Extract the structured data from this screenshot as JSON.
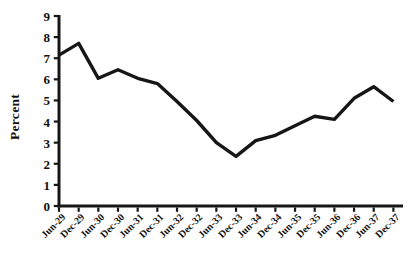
{
  "figure": {
    "title": "",
    "ylabel": "Percent"
  },
  "chart_data": {
    "type": "line",
    "title": "",
    "xlabel": "",
    "ylabel": "Percent",
    "categories": [
      "Jun-29",
      "Dec-29",
      "Jun-30",
      "Dec-30",
      "Jun-31",
      "Dec-31",
      "Jun-32",
      "Dec-32",
      "Jun-33",
      "Dec-33",
      "Jun-34",
      "Dec-34",
      "Jun-35",
      "Dec-35",
      "Jun-36",
      "Dec-36",
      "Jun-37",
      "Dec-37"
    ],
    "values": [
      7.15,
      7.7,
      6.05,
      6.45,
      6.05,
      5.8,
      4.95,
      4.05,
      3.0,
      2.35,
      3.1,
      3.35,
      3.8,
      4.25,
      4.1,
      5.1,
      5.65,
      4.95
    ],
    "ylim": [
      0,
      9
    ],
    "yticks": [
      0,
      1,
      2,
      3,
      4,
      5,
      6,
      7,
      8,
      9
    ],
    "grid": false,
    "legend": null,
    "series_name": "interest-rate",
    "line_color": "#161616",
    "axis_color": "#161616",
    "background": "#ffffff"
  }
}
